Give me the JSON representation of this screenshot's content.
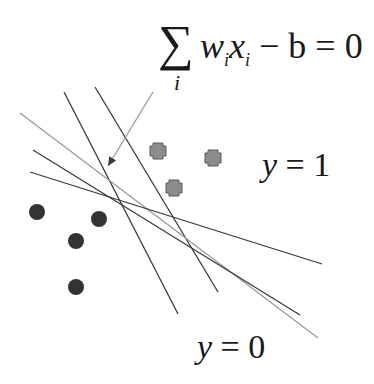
{
  "equation": {
    "operator": "∑",
    "index": "i",
    "weight": "w",
    "weight_sub": "i",
    "variable": "x",
    "variable_sub": "i",
    "rest": " − b = 0",
    "bias": "b",
    "rhs": "0"
  },
  "labels": {
    "class_positive_var": "y",
    "class_positive_eq": " = 1",
    "class_negative_var": "y",
    "class_negative_eq": " = 0"
  },
  "colors": {
    "line_dark": "#3a3a3a",
    "line_light": "#9a9a9a",
    "dot_fill": "#333333",
    "square_fill": "#8c8c8c",
    "square_stroke": "#5a5a5a"
  },
  "points": {
    "negative_dots": [
      {
        "x": 37,
        "y": 212
      },
      {
        "x": 99,
        "y": 219
      },
      {
        "x": 76,
        "y": 241
      },
      {
        "x": 76,
        "y": 287
      }
    ],
    "positive_squares": [
      {
        "x": 158,
        "y": 151
      },
      {
        "x": 213,
        "y": 158
      },
      {
        "x": 174,
        "y": 188
      }
    ]
  },
  "lines": [
    {
      "x1": 64,
      "y1": 92,
      "x2": 178,
      "y2": 314,
      "tone": "dark"
    },
    {
      "x1": 95,
      "y1": 87,
      "x2": 218,
      "y2": 292,
      "tone": "dark"
    },
    {
      "x1": 20,
      "y1": 113,
      "x2": 318,
      "y2": 338,
      "tone": "light"
    },
    {
      "x1": 33,
      "y1": 150,
      "x2": 300,
      "y2": 315,
      "tone": "dark"
    },
    {
      "x1": 30,
      "y1": 172,
      "x2": 322,
      "y2": 264,
      "tone": "dark"
    }
  ],
  "arrow": {
    "x1": 153,
    "y1": 92,
    "x2": 108,
    "y2": 166
  }
}
